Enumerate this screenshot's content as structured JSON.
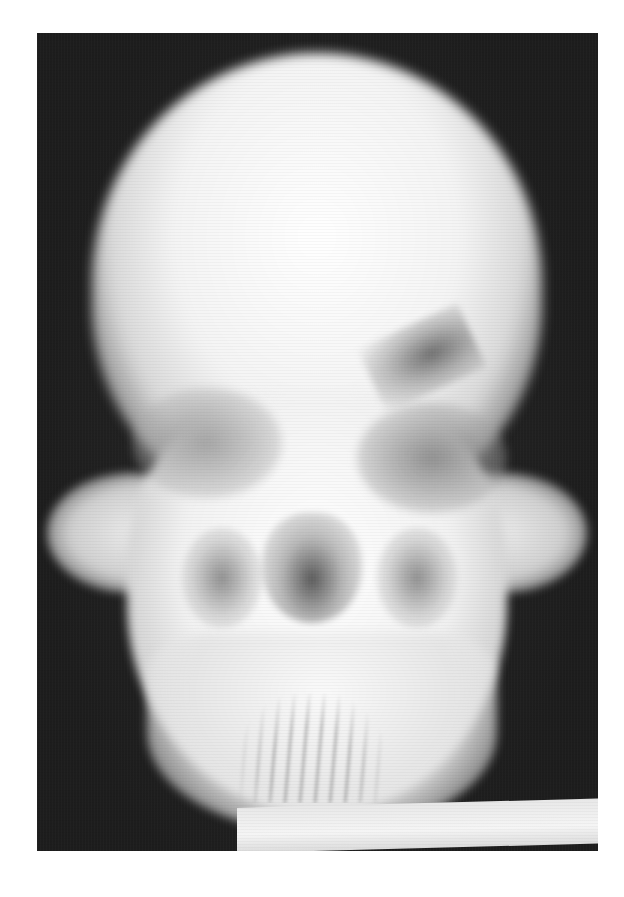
{
  "figure": {
    "alt": "Posteroanterior X-ray of a human skull showing cranium, orbits, nasal cavity, maxillary sinuses, zygomatic arches, mandible and teeth",
    "background_color": "#ffffff",
    "film_color": "#2a2a2a",
    "bone_color": "#f4f4f4",
    "label_strip_text": ""
  }
}
